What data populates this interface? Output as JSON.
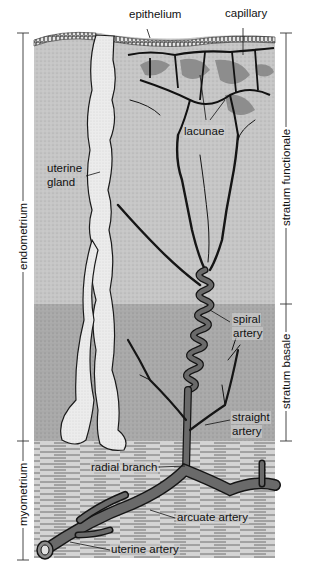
{
  "figure": {
    "colors": {
      "functionalis": "#c6c6c6",
      "basalis": "#a9a9a9",
      "myometrium": "#d2d2d2",
      "gland": "#ececec",
      "artery": "#5a5a5a",
      "vessel_outline": "#151515",
      "lacunae": "#8d8d8d"
    }
  },
  "labels": {
    "epithelium": "epithelium",
    "capillary": "capillary",
    "lacunae": "lacunae",
    "uterine_gland_line1": "uterine",
    "uterine_gland_line2": "gland",
    "spiral_artery_line1": "spiral",
    "spiral_artery_line2": "artery",
    "straight_artery_line1": "straight",
    "straight_artery_line2": "artery",
    "radial_branch": "radial branch",
    "arcuate_artery": "arcuate artery",
    "uterine_artery": "uterine artery"
  },
  "brackets": {
    "left": [
      {
        "label": "endometrium",
        "top": 33,
        "bottom": 441
      },
      {
        "label": "myometrium",
        "top": 441,
        "bottom": 560
      }
    ],
    "right": [
      {
        "label": "stratum functionale",
        "top": 33,
        "bottom": 304
      },
      {
        "label": "stratum basale",
        "top": 304,
        "bottom": 441
      }
    ]
  }
}
